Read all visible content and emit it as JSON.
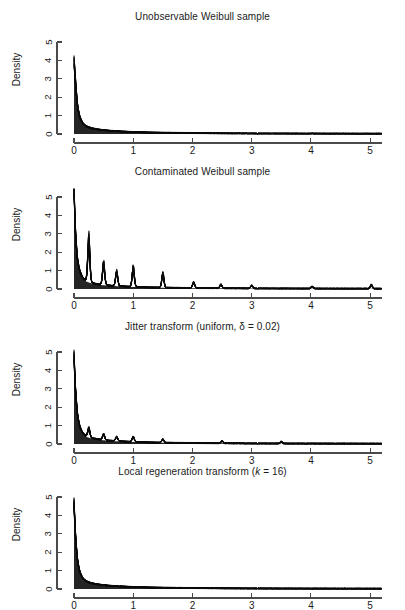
{
  "figure": {
    "width": 405,
    "height": 610,
    "background": "#ffffff",
    "ink_color": "#111111",
    "axis_color": "#4a4a4a"
  },
  "panels": [
    {
      "id": "unobservable",
      "title": "Unobservable Weibull sample",
      "title_suffix": "",
      "ylabel": "Density"
    },
    {
      "id": "contaminated",
      "title": "Contaminated Weibull sample",
      "title_suffix": "",
      "ylabel": "Density"
    },
    {
      "id": "jitter",
      "title": "Jitter transform (uniform, δ = 0.02)",
      "title_suffix": "",
      "ylabel": "Density"
    },
    {
      "id": "local-regeneration",
      "title_prefix": "Local regeneration transform (",
      "title_italic": "k",
      "title_suffix": " = 16)",
      "ylabel": "Density"
    }
  ],
  "chart_data": [
    {
      "type": "line",
      "title": "Unobservable Weibull sample",
      "xlabel": "",
      "ylabel": "Density",
      "xlim": [
        0,
        5.2
      ],
      "ylim": [
        0,
        5
      ],
      "xticks": [
        0,
        1,
        2,
        3,
        4,
        5
      ],
      "yticks": [
        0,
        1,
        2,
        3,
        4,
        5
      ],
      "grid": false,
      "legend": "none",
      "description": "Overlay of many kernel density estimates of an uncontaminated Weibull sample; monotone decreasing with peak density about 3.95 at x=0 decaying to near zero by x=1.5.",
      "peak_density": 3.95,
      "x": [
        0.0,
        0.02,
        0.04,
        0.06,
        0.08,
        0.1,
        0.14,
        0.18,
        0.22,
        0.3,
        0.4,
        0.5,
        0.6,
        0.8,
        1.0,
        1.25,
        1.5,
        2.0,
        2.5,
        3.0,
        3.5,
        4.0,
        4.5,
        5.0,
        5.2
      ],
      "y": [
        3.95,
        3.1,
        2.2,
        1.55,
        1.15,
        0.9,
        0.62,
        0.48,
        0.4,
        0.31,
        0.25,
        0.21,
        0.18,
        0.14,
        0.11,
        0.085,
        0.07,
        0.05,
        0.035,
        0.025,
        0.02,
        0.015,
        0.012,
        0.01,
        0.009
      ],
      "spikes": []
    },
    {
      "type": "line",
      "title": "Contaminated Weibull sample",
      "xlabel": "",
      "ylabel": "Density",
      "xlim": [
        0,
        5.2
      ],
      "ylim": [
        0,
        5.4
      ],
      "xticks": [
        0,
        1,
        2,
        3,
        4,
        5
      ],
      "yticks": [
        0,
        1,
        2,
        3,
        4,
        5
      ],
      "grid": false,
      "legend": "none",
      "description": "Same sample rounded to a coarse grid: density estimates show tall narrow spikes at the rounding lattice points, peak at x=0 reaching about 5.4.",
      "peak_density": 5.4,
      "x": [
        0.0,
        0.02,
        0.04,
        0.06,
        0.08,
        0.1,
        0.14,
        0.18,
        0.22,
        0.3,
        0.4,
        0.5,
        0.6,
        0.8,
        1.0,
        1.25,
        1.5,
        2.0,
        2.5,
        3.0,
        3.5,
        4.0,
        4.5,
        5.0,
        5.2
      ],
      "y": [
        5.4,
        3.4,
        2.3,
        1.6,
        1.2,
        0.95,
        0.65,
        0.5,
        0.42,
        0.33,
        0.26,
        0.22,
        0.19,
        0.15,
        0.12,
        0.09,
        0.075,
        0.05,
        0.04,
        0.028,
        0.022,
        0.016,
        0.013,
        0.011,
        0.01
      ],
      "spikes": [
        {
          "x": 0.25,
          "height": 2.25
        },
        {
          "x": 0.5,
          "height": 1.12
        },
        {
          "x": 0.72,
          "height": 0.75
        },
        {
          "x": 1.0,
          "height": 1.0
        },
        {
          "x": 1.5,
          "height": 0.72
        },
        {
          "x": 2.02,
          "height": 0.3
        },
        {
          "x": 2.48,
          "height": 0.2
        },
        {
          "x": 3.0,
          "height": 0.16
        },
        {
          "x": 4.02,
          "height": 0.12
        },
        {
          "x": 5.02,
          "height": 0.2
        }
      ]
    },
    {
      "type": "line",
      "title": "Jitter transform (uniform, δ = 0.02)",
      "xlabel": "",
      "ylabel": "Density",
      "xlim": [
        0,
        5.2
      ],
      "ylim": [
        0,
        4.8
      ],
      "xticks": [
        0,
        1,
        2,
        3,
        4,
        5
      ],
      "yticks": [
        0,
        1,
        2,
        3,
        4,
        5
      ],
      "grid": false,
      "legend": "none",
      "description": "Contaminated sample after uniform jitter of width delta = 0.02; lattice spikes are flattened into small residual bumps, peak about 4.75 at x=0.",
      "peak_density": 4.75,
      "x": [
        0.0,
        0.02,
        0.04,
        0.06,
        0.08,
        0.1,
        0.14,
        0.18,
        0.22,
        0.3,
        0.4,
        0.5,
        0.6,
        0.8,
        1.0,
        1.25,
        1.5,
        2.0,
        2.5,
        3.0,
        3.5,
        4.0,
        4.5,
        5.0,
        5.2
      ],
      "y": [
        4.75,
        3.2,
        2.25,
        1.58,
        1.18,
        0.92,
        0.63,
        0.49,
        0.41,
        0.32,
        0.26,
        0.22,
        0.185,
        0.145,
        0.115,
        0.088,
        0.072,
        0.05,
        0.038,
        0.026,
        0.021,
        0.016,
        0.013,
        0.011,
        0.01
      ],
      "spikes": [
        {
          "x": 0.25,
          "height": 0.46
        },
        {
          "x": 0.5,
          "height": 0.3
        },
        {
          "x": 0.72,
          "height": 0.22
        },
        {
          "x": 1.0,
          "height": 0.26
        },
        {
          "x": 1.5,
          "height": 0.18
        },
        {
          "x": 2.5,
          "height": 0.12
        },
        {
          "x": 3.5,
          "height": 0.1
        }
      ]
    },
    {
      "type": "line",
      "title": "Local regeneration transform (k = 16)",
      "xlabel": "",
      "ylabel": "Density",
      "xlim": [
        0,
        5.2
      ],
      "ylim": [
        0,
        4.6
      ],
      "xticks": [
        0,
        1,
        2,
        3,
        4,
        5
      ],
      "yticks": [
        0,
        1,
        2,
        3,
        4,
        5
      ],
      "grid": false,
      "legend": "none",
      "description": "Contaminated sample after local regeneration transform with k = 16 neighbours; curve is smooth and closely matches the unobservable sample, peak about 4.6 at x=0.",
      "peak_density": 4.6,
      "x": [
        0.0,
        0.02,
        0.04,
        0.06,
        0.08,
        0.1,
        0.14,
        0.18,
        0.22,
        0.3,
        0.4,
        0.5,
        0.6,
        0.8,
        1.0,
        1.25,
        1.5,
        2.0,
        2.5,
        3.0,
        3.5,
        4.0,
        4.5,
        5.0,
        5.2
      ],
      "y": [
        4.6,
        3.15,
        2.2,
        1.55,
        1.16,
        0.9,
        0.62,
        0.48,
        0.4,
        0.31,
        0.25,
        0.21,
        0.18,
        0.14,
        0.11,
        0.085,
        0.07,
        0.05,
        0.035,
        0.025,
        0.02,
        0.015,
        0.012,
        0.01,
        0.009
      ],
      "spikes": []
    }
  ],
  "axes": {
    "xticks": [
      "0",
      "1",
      "2",
      "3",
      "4",
      "5"
    ],
    "yticks": [
      "0",
      "1",
      "2",
      "3",
      "4",
      "5"
    ]
  }
}
